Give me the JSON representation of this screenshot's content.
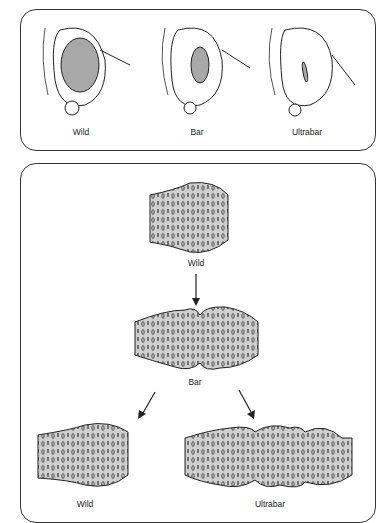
{
  "top_panel": {
    "eyes": [
      {
        "label": "Wild",
        "eye_size": "large"
      },
      {
        "label": "Bar",
        "eye_size": "medium"
      },
      {
        "label": "Ultrabar",
        "eye_size": "narrow slit"
      }
    ]
  },
  "bottom_panel": {
    "chromosomes": [
      {
        "label": "Wild",
        "segment_copies": 1,
        "position": "top"
      },
      {
        "label": "Bar",
        "segment_copies": 2,
        "position": "middle"
      },
      {
        "label": "Wild",
        "segment_copies": 1,
        "position": "bottom-left"
      },
      {
        "label": "Ultrabar",
        "segment_copies": 3,
        "position": "bottom-right"
      }
    ],
    "arrows": [
      {
        "from": "Wild",
        "to": "Bar"
      },
      {
        "from": "Bar",
        "to": "Wild"
      },
      {
        "from": "Bar",
        "to": "Ultrabar"
      }
    ]
  },
  "colors": {
    "chromosome_fill": "#cfcfcf",
    "eye_fill": "#a8a8a8",
    "outline": "#222222"
  }
}
